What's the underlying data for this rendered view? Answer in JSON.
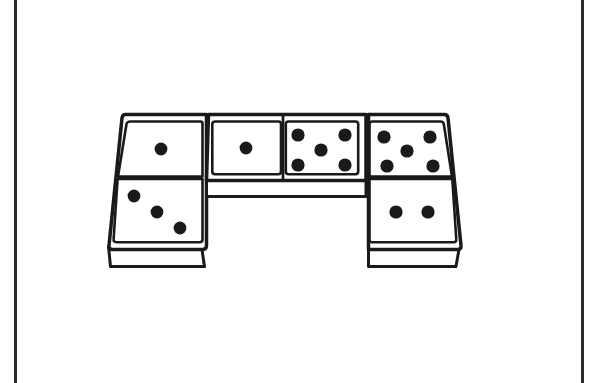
{
  "page": {
    "width": 591,
    "height": 383,
    "background_color": "#ffffff",
    "ink_color": "#1a1a1a",
    "title": "Three dominoes arranged in a bridge shape",
    "description": "Black and white line drawing of three dominoes shown in oblique perspective, arranged in a U or bridge shape: two vertical dominoes standing at the left and right, joined across the top by one horizontal domino."
  },
  "rules": {
    "left_label": "left page rule",
    "right_label": "right page rule",
    "color": "#2b2b2b",
    "thickness": 3
  },
  "figure": {
    "style": "line-art",
    "stroke_color": "#1a1a1a",
    "fill_color": "#ffffff",
    "pip_color": "#1a1a1a",
    "domino_count": 3,
    "total_pip_count": 17
  },
  "dominoes": [
    {
      "id": "domino-left",
      "label": "Left vertical domino",
      "orientation": "vertical",
      "position": "left",
      "faces": [
        {
          "id": "face-left-top",
          "label": "top face",
          "pips": 1,
          "pattern": "center"
        },
        {
          "id": "face-left-bottom",
          "label": "bottom face",
          "pips": 3,
          "pattern": "diagonal"
        }
      ],
      "value": "1-3",
      "pip_total": 4
    },
    {
      "id": "domino-middle",
      "label": "Middle horizontal domino",
      "orientation": "horizontal",
      "position": "top-center",
      "faces": [
        {
          "id": "face-middle-left",
          "label": "left face",
          "pips": 1,
          "pattern": "center"
        },
        {
          "id": "face-middle-right",
          "label": "right face",
          "pips": 5,
          "pattern": "quincunx"
        }
      ],
      "value": "1-5",
      "pip_total": 6
    },
    {
      "id": "domino-right",
      "label": "Right vertical domino",
      "orientation": "vertical",
      "position": "right",
      "faces": [
        {
          "id": "face-right-top",
          "label": "top face",
          "pips": 5,
          "pattern": "quincunx"
        },
        {
          "id": "face-right-bottom",
          "label": "bottom face",
          "pips": 2,
          "pattern": "horizontal-pair"
        }
      ],
      "value": "5-2",
      "pip_total": 7
    }
  ]
}
